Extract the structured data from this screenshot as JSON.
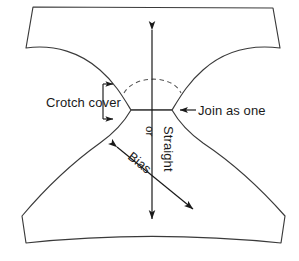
{
  "figure": {
    "type": "sewing-pattern-diagram",
    "background_color": "#ffffff",
    "line_color": "#3a3a3a",
    "text_color": "#1a1a1a",
    "width": 299,
    "height": 261
  },
  "labels": {
    "crotch_cover": "Crotch cover",
    "join_as_one": "Join as one",
    "straight": "Straight",
    "or": "or",
    "bias": "Bias"
  },
  "annotations": {
    "grain_axis_vertical": "Straight",
    "grain_axis_diagonal": "Bias",
    "conjunction": "or",
    "left_callout": "Crotch cover",
    "right_callout": "Join as one",
    "dashed_arc_note": "crotch seam guide arc"
  },
  "icons": {
    "vertical_double_arrow": "double-arrow-vertical-icon",
    "diagonal_double_arrow": "double-arrow-diagonal-icon",
    "left_pointer": "arrow-left-icon",
    "bracket_pointer": "bracket-right-icon"
  }
}
